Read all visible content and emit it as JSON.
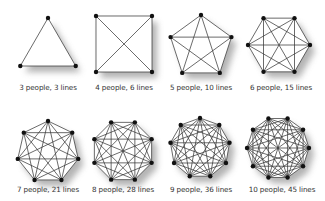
{
  "colors": {
    "background": "#ffffff",
    "line": "#3a3a3a",
    "node": "#111111",
    "shadow": "#9a9a9a",
    "label": "#333333"
  },
  "figures": [
    {
      "people": 3,
      "lines": 3,
      "label": "3 people, 3 lines",
      "cx": 48,
      "cy": 50,
      "r": 32,
      "rotation": -90
    },
    {
      "people": 4,
      "lines": 6,
      "label": "4 people, 6 lines",
      "cx": 124,
      "cy": 44,
      "r": 39.6,
      "rotation": -135
    },
    {
      "people": 5,
      "lines": 10,
      "label": "5 people, 10 lines",
      "cx": 201,
      "cy": 47,
      "r": 32,
      "rotation": -90
    },
    {
      "people": 6,
      "lines": 15,
      "label": "6 people, 15 lines",
      "cx": 279,
      "cy": 45,
      "r": 31,
      "rotation": -120
    },
    {
      "people": 7,
      "lines": 21,
      "label": "7 people, 21 lines",
      "cx": 48,
      "cy": 152,
      "r": 31,
      "rotation": -90
    },
    {
      "people": 8,
      "lines": 28,
      "label": "8 people, 28 lines",
      "cx": 123,
      "cy": 151,
      "r": 31,
      "rotation": -112.5
    },
    {
      "people": 9,
      "lines": 36,
      "label": "9 people, 36 lines",
      "cx": 200,
      "cy": 148,
      "r": 30,
      "rotation": -90
    },
    {
      "people": 10,
      "lines": 45,
      "label": "10 people, 45 lines",
      "cx": 278,
      "cy": 148,
      "r": 31,
      "rotation": -108
    }
  ],
  "label_positions": [
    {
      "x": 48,
      "y": 88
    },
    {
      "x": 124,
      "y": 88
    },
    {
      "x": 201,
      "y": 88
    },
    {
      "x": 281,
      "y": 88
    },
    {
      "x": 48,
      "y": 190
    },
    {
      "x": 123,
      "y": 190
    },
    {
      "x": 201,
      "y": 190
    },
    {
      "x": 282,
      "y": 190
    }
  ]
}
